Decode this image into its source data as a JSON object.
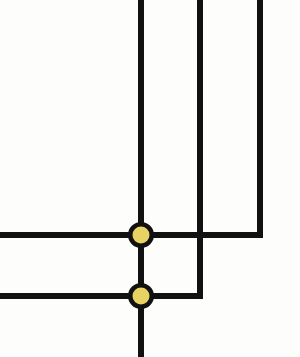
{
  "figure": {
    "background_color": "#fdfdfb",
    "width": 300,
    "height": 357,
    "wire_color": "#111111",
    "node_fill_color": "#e8d263",
    "node_ring_color": "#111111",
    "wire_thickness_px": 6,
    "node_outer_diameter_px": 26,
    "node_inner_diameter_px": 17
  },
  "chart_data": {
    "type": "diagram",
    "coordinate_space": {
      "x_range": [
        0,
        300
      ],
      "y_range": [
        0,
        357
      ],
      "origin": "top-left"
    },
    "vertical_wires": [
      {
        "id": "bus-main",
        "label": "main vertical bus",
        "x": 141,
        "y_start": 0,
        "y_end": 357,
        "passes_nodes": [
          "node-upper",
          "node-lower"
        ]
      },
      {
        "id": "branch-mid",
        "label": "middle branch",
        "x": 200,
        "y_start": 0,
        "y_end": 296,
        "terminates_into": "rail-lower"
      },
      {
        "id": "branch-right",
        "label": "right branch",
        "x": 260,
        "y_start": 0,
        "y_end": 235,
        "terminates_into": "rail-upper"
      }
    ],
    "horizontal_wires": [
      {
        "id": "rail-upper",
        "label": "upper horizontal rail",
        "y": 235,
        "x_start": 0,
        "x_end": 263,
        "crosses": [
          "branch-mid"
        ],
        "node": "node-upper"
      },
      {
        "id": "rail-lower",
        "label": "lower horizontal rail",
        "y": 296,
        "x_start": 0,
        "x_end": 203,
        "crosses": [],
        "node": "node-lower"
      }
    ],
    "crossings": [
      {
        "id": "crossing-mid-upper",
        "label": "non-connecting crossing",
        "x": 200,
        "y": 235,
        "connected": false
      }
    ],
    "nodes": [
      {
        "id": "node-upper",
        "label": "upper junction node",
        "x": 141,
        "y": 235,
        "outer_diameter": 26,
        "inner_diameter": 17,
        "fill": "#e8d263",
        "ring": "#111111",
        "connected": true
      },
      {
        "id": "node-lower",
        "label": "lower junction node",
        "x": 141,
        "y": 296,
        "outer_diameter": 26,
        "inner_diameter": 17,
        "fill": "#e8d263",
        "ring": "#111111",
        "connected": true
      }
    ],
    "legend": [],
    "annotations": [],
    "grid": false
  }
}
